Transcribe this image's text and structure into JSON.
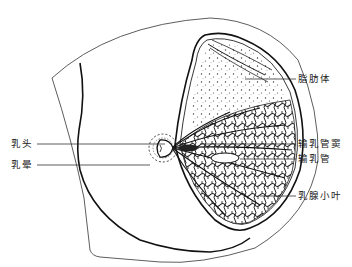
{
  "figure": {
    "labels": {
      "fat_body": "脂肪体",
      "lactiferous_sinus": "输乳管窦",
      "lactiferous_duct": "输乳管",
      "mammary_lobule": "乳腺小叶",
      "nipple": "乳头",
      "areola": "乳晕"
    },
    "colors": {
      "ink": "#222222",
      "background": "#ffffff"
    }
  }
}
